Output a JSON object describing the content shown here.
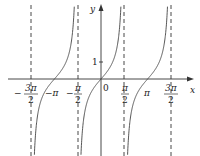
{
  "chart_data": {
    "type": "line",
    "title": "",
    "function": "y = tan x",
    "xlabel": "x",
    "ylabel": "y",
    "xlim": [
      -4.85,
      4.2
    ],
    "ylim": [
      -4.5,
      4.5
    ],
    "grid": false,
    "legend": null,
    "origin_label": "0",
    "y_tick_label": "1",
    "x_ticks": [
      {
        "value": -4.712,
        "num": "3π",
        "den": "2",
        "sign": "−",
        "fraction": true
      },
      {
        "value": -3.1416,
        "text": "−π",
        "fraction": false
      },
      {
        "value": -1.5708,
        "num": "π",
        "den": "2",
        "sign": "−",
        "fraction": true
      },
      {
        "value": 1.5708,
        "num": "π",
        "den": "2",
        "sign": "",
        "fraction": true
      },
      {
        "value": 3.1416,
        "text": "π",
        "fraction": false
      },
      {
        "value": 4.712,
        "num": "3π",
        "den": "2",
        "sign": "",
        "fraction": true
      }
    ],
    "asymptotes": [
      -4.712,
      -1.5708,
      1.5708,
      4.712
    ],
    "series": [
      {
        "name": "tan x",
        "branch_centers": [
          -3.1416,
          0,
          3.1416
        ]
      }
    ]
  },
  "labels": {
    "x_axis": "x",
    "y_axis": "y",
    "origin": "0",
    "one": "1",
    "neg_pi": "−π",
    "pi": "π",
    "neg_sign": "−",
    "three_pi": "3π",
    "pi_num": "π",
    "two": "2"
  }
}
